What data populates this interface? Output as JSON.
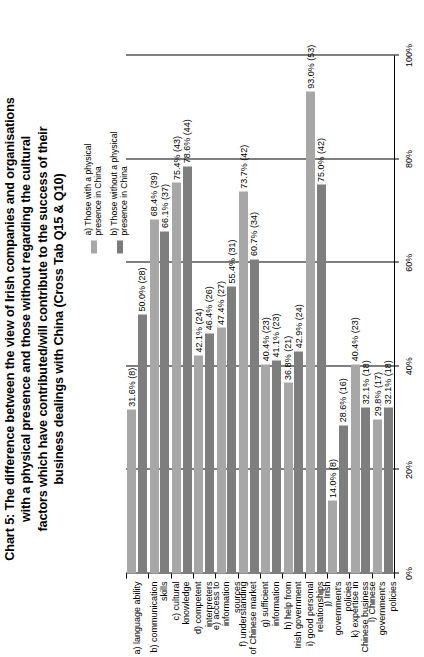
{
  "chart_data": {
    "type": "bar",
    "title_lines": [
      "Chart 5: The difference between the view of Irish companies and organisations",
      "with a physical presence and those without regarding the cultural",
      "factors which have contributed/will contribute to the success of their",
      "business dealings with China (Cross Tab Q15 & Q10)"
    ],
    "orientation": "vertical-bars-rotated",
    "categories": [
      "a) language ability",
      "b) communication skills",
      "c) cultural knowledge",
      "d) competent\ninterpreters",
      "e) access to\ninformation sources",
      "f) understanding\nof Chinese market",
      "g) sufficient\ninformation",
      "h) help from\nIrish government",
      "i) good personal\nrelationships",
      "j) Irish government's\npolicies",
      "k) expertise in\nChinese business",
      "l) Chinese\ngovernment's policies"
    ],
    "series": [
      {
        "name": "a) Those with a physical presence in China",
        "color": "#a7a7a7",
        "values": [
          31.6,
          68.4,
          75.4,
          42.1,
          47.4,
          73.7,
          40.4,
          36.8,
          93.0,
          14.0,
          40.4,
          29.8
        ],
        "counts": [
          8,
          39,
          43,
          24,
          27,
          42,
          23,
          21,
          53,
          8,
          23,
          17
        ],
        "labels": [
          "31.6% (8)",
          "68.4% (39)",
          "75.4% (43)",
          "42.1% (24)",
          "47.4% (27)",
          "73.7% (42)",
          "40.4% (23)",
          "36.8% (21)",
          "93.0% (53)",
          "14.0% (8)",
          "40.4% (23)",
          "29.8% (17)"
        ]
      },
      {
        "name": "b) Those without a physical presence in China",
        "color": "#7e7e7e",
        "values": [
          50.0,
          66.1,
          78.6,
          46.4,
          55.4,
          60.7,
          41.1,
          42.9,
          75.0,
          28.6,
          32.1,
          32.1
        ],
        "counts": [
          28,
          37,
          44,
          26,
          31,
          34,
          23,
          24,
          42,
          16,
          18,
          18
        ],
        "labels": [
          "50.0% (28)",
          "66.1% (37)",
          "78.6% (44)",
          "46.4% (26)",
          "55.4% (31)",
          "60.7% (34)",
          "41.1% (23)",
          "42.9% (24)",
          "75.0% (42)",
          "28.6% (16)",
          "32.1% (18)",
          "32.1% (18)"
        ]
      }
    ],
    "xlabel": "",
    "ylabel": "",
    "ylim": [
      0,
      100
    ],
    "tick_labels": [
      "0%",
      "20%",
      "40%",
      "60%",
      "80%",
      "100%"
    ],
    "tick_values": [
      0,
      20,
      40,
      60,
      80,
      100
    ],
    "grid": true,
    "legend_position": "top-right",
    "legend": [
      {
        "label_lines": [
          "a) Those with a physical",
          "presence in China"
        ],
        "color": "#a7a7a7"
      },
      {
        "label_lines": [
          "b) Those without a physical",
          "presence in China"
        ],
        "color": "#7e7e7e"
      }
    ]
  }
}
